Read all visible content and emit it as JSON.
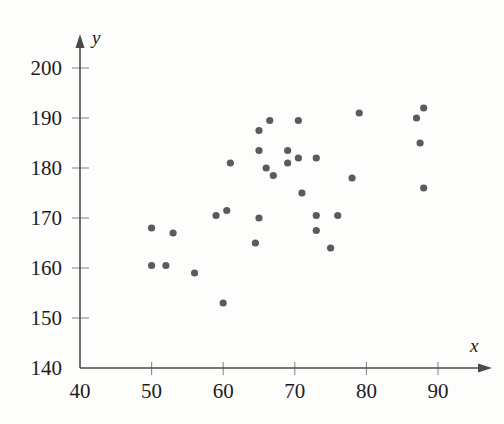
{
  "chart_data": {
    "type": "scatter",
    "title": "",
    "xlabel": "x",
    "ylabel": "y",
    "xlim": [
      40,
      93
    ],
    "ylim": [
      140,
      204
    ],
    "grid": false,
    "legend": null,
    "xticks": [
      40,
      50,
      60,
      70,
      80,
      90
    ],
    "yticks": [
      140,
      150,
      160,
      170,
      180,
      190,
      200
    ],
    "xtick_labels": [
      "40",
      "50",
      "60",
      "70",
      "80",
      "90"
    ],
    "ytick_labels": [
      "140",
      "150",
      "160",
      "170",
      "180",
      "190",
      "200"
    ],
    "point_color": "#5b5b5f",
    "point_radius": 3.6,
    "points": [
      {
        "x": 50.0,
        "y": 168.0
      },
      {
        "x": 53.0,
        "y": 167.0
      },
      {
        "x": 50.0,
        "y": 160.5
      },
      {
        "x": 52.0,
        "y": 160.5
      },
      {
        "x": 56.0,
        "y": 159.0
      },
      {
        "x": 59.0,
        "y": 170.5
      },
      {
        "x": 60.5,
        "y": 171.5
      },
      {
        "x": 60.0,
        "y": 153.0
      },
      {
        "x": 61.0,
        "y": 181.0
      },
      {
        "x": 65.0,
        "y": 170.0
      },
      {
        "x": 64.5,
        "y": 165.0
      },
      {
        "x": 65.0,
        "y": 187.5
      },
      {
        "x": 65.0,
        "y": 183.5
      },
      {
        "x": 66.0,
        "y": 180.0
      },
      {
        "x": 66.5,
        "y": 189.5
      },
      {
        "x": 67.0,
        "y": 178.5
      },
      {
        "x": 69.0,
        "y": 183.5
      },
      {
        "x": 69.0,
        "y": 181.0
      },
      {
        "x": 70.5,
        "y": 189.5
      },
      {
        "x": 70.5,
        "y": 182.0
      },
      {
        "x": 71.0,
        "y": 175.0
      },
      {
        "x": 73.0,
        "y": 182.0
      },
      {
        "x": 73.0,
        "y": 170.5
      },
      {
        "x": 73.0,
        "y": 167.5
      },
      {
        "x": 75.0,
        "y": 164.0
      },
      {
        "x": 76.0,
        "y": 170.5
      },
      {
        "x": 78.0,
        "y": 178.0
      },
      {
        "x": 79.0,
        "y": 191.0
      },
      {
        "x": 87.0,
        "y": 190.0
      },
      {
        "x": 88.0,
        "y": 192.0
      },
      {
        "x": 87.5,
        "y": 185.0
      },
      {
        "x": 88.0,
        "y": 176.0
      }
    ]
  },
  "geometry": {
    "x_origin_px": 80,
    "y_origin_px": 368,
    "x_unit_px": 7.16,
    "y_unit_px": 5.0
  }
}
